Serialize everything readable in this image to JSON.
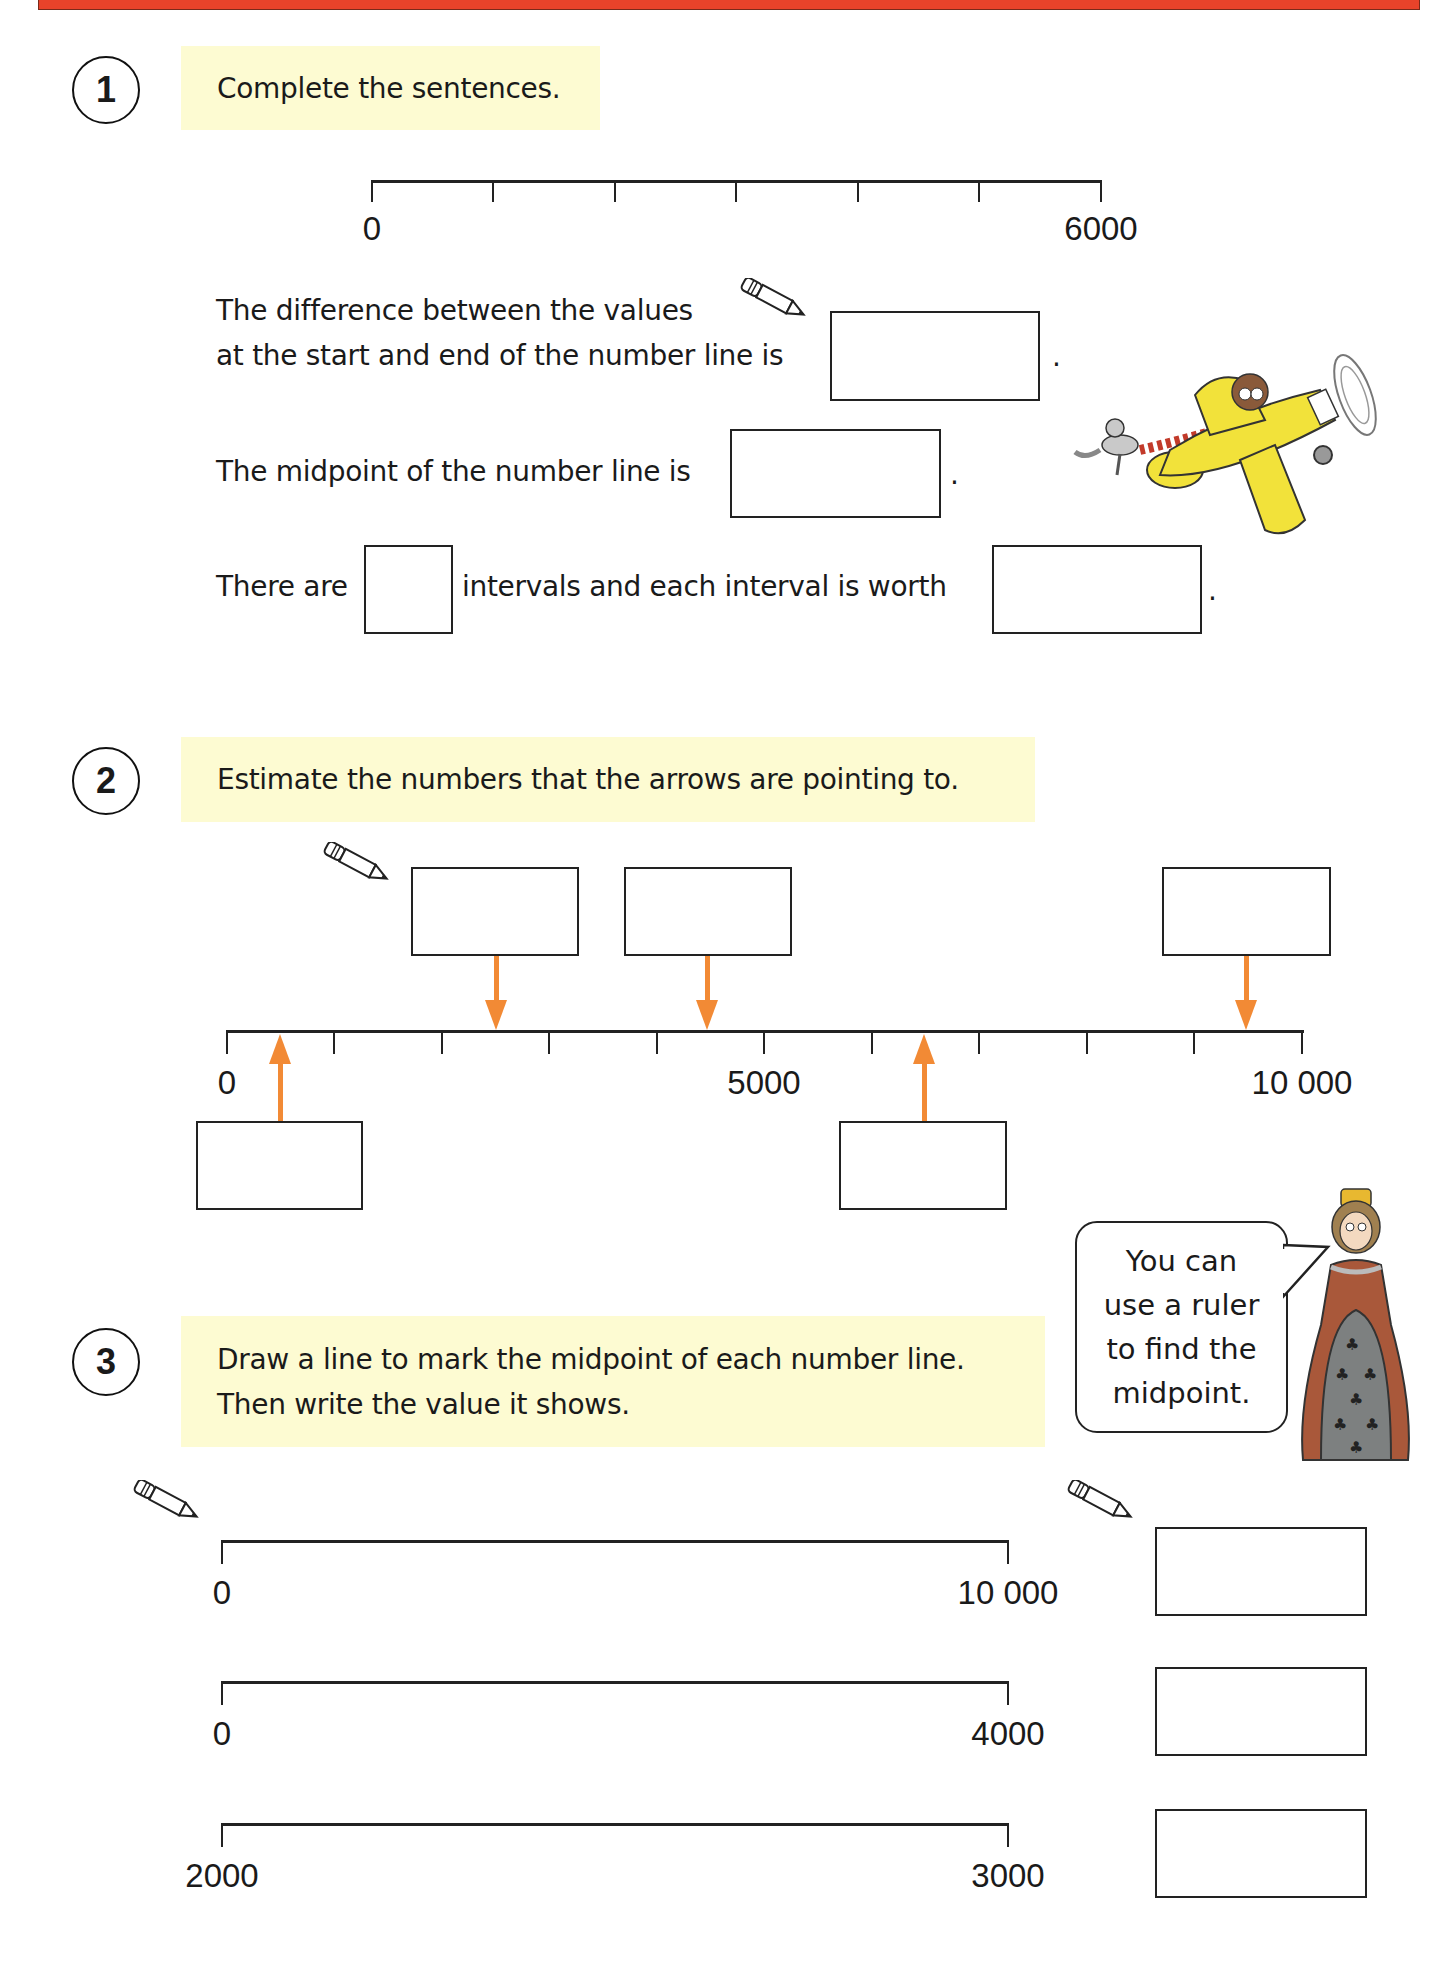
{
  "header": {
    "bar_color": "#e8432a"
  },
  "questions": [
    {
      "number": "1",
      "instruction": "Complete the sentences.",
      "number_line": {
        "start": "0",
        "end": "6000",
        "intervals": 6
      },
      "sentences": {
        "s1_line1": "The difference between the values",
        "s1_line2": "at the start and end of the number line is",
        "s2": "The midpoint of the number line is",
        "s3_part1": "There are",
        "s3_part2": "intervals and each interval is worth",
        "period": "."
      }
    },
    {
      "number": "2",
      "instruction": "Estimate the numbers that the arrows are pointing to.",
      "number_line": {
        "start": "0",
        "mid": "5000",
        "end": "10 000",
        "intervals": 10
      },
      "arrows": [
        {
          "direction": "up",
          "approx_value": 500
        },
        {
          "direction": "down",
          "approx_value": 2500
        },
        {
          "direction": "down",
          "approx_value": 4500
        },
        {
          "direction": "up",
          "approx_value": 6500
        },
        {
          "direction": "down",
          "approx_value": 9500
        }
      ],
      "arrow_color": "#f28a35"
    },
    {
      "number": "3",
      "instruction_line1": "Draw a line to mark the midpoint of each number line.",
      "instruction_line2": "Then write the value it shows.",
      "number_lines": [
        {
          "start": "0",
          "end": "10 000"
        },
        {
          "start": "0",
          "end": "4000"
        },
        {
          "start": "2000",
          "end": "3000"
        }
      ],
      "tip": {
        "line1": "You can",
        "line2": "use a ruler",
        "line3": "to find the",
        "line4": "midpoint."
      }
    }
  ],
  "colors": {
    "instruction_bg": "#fdfbd2",
    "accent_orange": "#f28a35",
    "plane_yellow": "#f2e23a",
    "dress_brown": "#a9583a",
    "dress_gray": "#7d8080"
  }
}
